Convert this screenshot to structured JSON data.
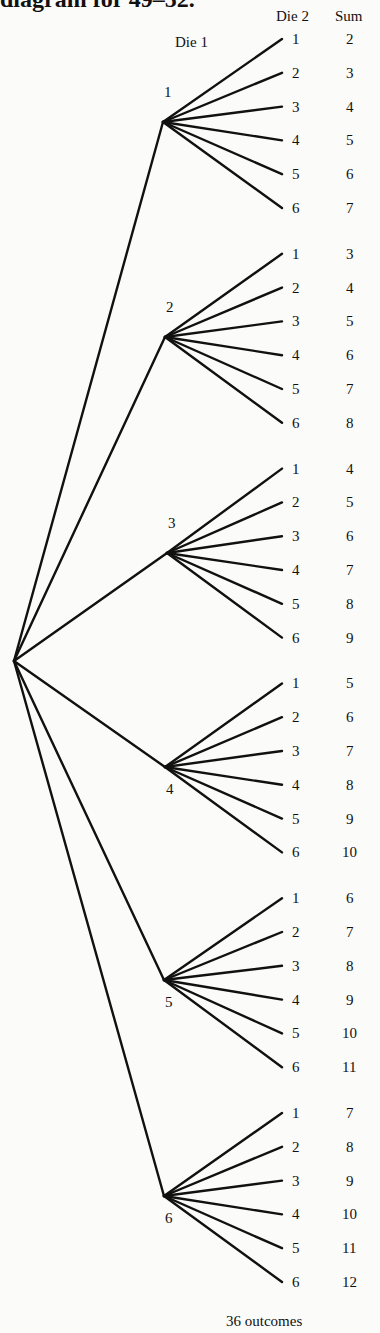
{
  "title": "diagram for 49–52.",
  "headers": {
    "die1": "Die 1",
    "die2": "Die 2",
    "sum": "Sum"
  },
  "footer": "36 outcomes",
  "colors": {
    "line": "#111111",
    "background": "#fbfbfa"
  },
  "root": {
    "x": 14,
    "y": 661
  },
  "branches": [
    {
      "die1": "1",
      "node": {
        "x": 163,
        "y": 122
      },
      "label_pos": "above",
      "outcomes": [
        {
          "die2": "1",
          "sum": "2"
        },
        {
          "die2": "2",
          "sum": "3"
        },
        {
          "die2": "3",
          "sum": "4"
        },
        {
          "die2": "4",
          "sum": "5"
        },
        {
          "die2": "5",
          "sum": "6"
        },
        {
          "die2": "6",
          "sum": "7"
        }
      ]
    },
    {
      "die1": "2",
      "node": {
        "x": 165,
        "y": 337
      },
      "label_pos": "above",
      "outcomes": [
        {
          "die2": "1",
          "sum": "3"
        },
        {
          "die2": "2",
          "sum": "4"
        },
        {
          "die2": "3",
          "sum": "5"
        },
        {
          "die2": "4",
          "sum": "6"
        },
        {
          "die2": "5",
          "sum": "7"
        },
        {
          "die2": "6",
          "sum": "8"
        }
      ]
    },
    {
      "die1": "3",
      "node": {
        "x": 167,
        "y": 553
      },
      "label_pos": "above",
      "outcomes": [
        {
          "die2": "1",
          "sum": "4"
        },
        {
          "die2": "2",
          "sum": "5"
        },
        {
          "die2": "3",
          "sum": "6"
        },
        {
          "die2": "4",
          "sum": "7"
        },
        {
          "die2": "5",
          "sum": "8"
        },
        {
          "die2": "6",
          "sum": "9"
        }
      ]
    },
    {
      "die1": "4",
      "node": {
        "x": 165,
        "y": 767
      },
      "label_pos": "below",
      "outcomes": [
        {
          "die2": "1",
          "sum": "5"
        },
        {
          "die2": "2",
          "sum": "6"
        },
        {
          "die2": "3",
          "sum": "7"
        },
        {
          "die2": "4",
          "sum": "8"
        },
        {
          "die2": "5",
          "sum": "9"
        },
        {
          "die2": "6",
          "sum": "10"
        }
      ]
    },
    {
      "die1": "5",
      "node": {
        "x": 164,
        "y": 980
      },
      "label_pos": "below",
      "outcomes": [
        {
          "die2": "1",
          "sum": "6"
        },
        {
          "die2": "2",
          "sum": "7"
        },
        {
          "die2": "3",
          "sum": "8"
        },
        {
          "die2": "4",
          "sum": "9"
        },
        {
          "die2": "5",
          "sum": "10"
        },
        {
          "die2": "6",
          "sum": "11"
        }
      ]
    },
    {
      "die1": "6",
      "node": {
        "x": 164,
        "y": 1196
      },
      "label_pos": "below",
      "outcomes": [
        {
          "die2": "1",
          "sum": "7"
        },
        {
          "die2": "2",
          "sum": "8"
        },
        {
          "die2": "3",
          "sum": "9"
        },
        {
          "die2": "4",
          "sum": "10"
        },
        {
          "die2": "5",
          "sum": "11"
        },
        {
          "die2": "6",
          "sum": "12"
        }
      ]
    }
  ],
  "layout": {
    "leaf_x": 282,
    "die2_x": 292,
    "sum_x": 346,
    "first_leaf_y": 39,
    "leaf_step": 33.8,
    "group_step": 214.8
  }
}
